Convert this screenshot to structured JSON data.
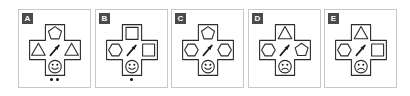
{
  "figure": {
    "type": "shape-puzzle-panels",
    "panel_count": 5,
    "colors": {
      "panel_border": "#c8c8c8",
      "label_chip_bg": "#4a4a4a",
      "label_chip_text": "#ffffff",
      "outline_stroke": "#2b2b2b",
      "shape_fill": "#ffffff",
      "ink": "#1a1a1a",
      "background": "#ffffff"
    }
  },
  "panels": [
    {
      "label": "A",
      "top_shape": "pentagon",
      "left_shape": "triangle",
      "right_shape": "triangle",
      "bottom_shape": "happy-face",
      "center_shape": "arrow-up-right",
      "dot_count": 2
    },
    {
      "label": "B",
      "top_shape": "square",
      "left_shape": "hexagon",
      "right_shape": "square",
      "bottom_shape": "happy-face",
      "center_shape": "arrow-up-right",
      "dot_count": 1
    },
    {
      "label": "C",
      "top_shape": "pentagon",
      "left_shape": "hexagon",
      "right_shape": "hexagon",
      "bottom_shape": "happy-face",
      "center_shape": "arrow-up-right",
      "dot_count": 0
    },
    {
      "label": "D",
      "top_shape": "triangle",
      "left_shape": "hexagon",
      "right_shape": "pentagon",
      "bottom_shape": "sad-face",
      "center_shape": "arrow-up-right",
      "dot_count": 0
    },
    {
      "label": "E",
      "top_shape": "triangle",
      "left_shape": "hexagon",
      "right_shape": "square",
      "bottom_shape": "sad-face",
      "center_shape": "arrow-up-right",
      "dot_count": 0
    }
  ]
}
